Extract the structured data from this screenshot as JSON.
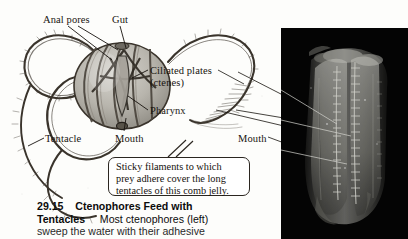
{
  "figure": {
    "domain_kind": "textbook-figure",
    "background_color": "#fdfdfb",
    "ink_color": "#18140f"
  },
  "diagram": {
    "title_implied": "Ctenophore (comb jelly) anatomy drawing",
    "labels": [
      {
        "id": "anal-pores",
        "text": "Anal pores"
      },
      {
        "id": "gut",
        "text": "Gut"
      },
      {
        "id": "ciliated-plates",
        "text": "Ciliated plates"
      },
      {
        "id": "ctenes",
        "text": "(ctenes)"
      },
      {
        "id": "pharynx",
        "text": "Pharynx"
      },
      {
        "id": "tentacle",
        "text": "Tentacle"
      },
      {
        "id": "mouth-diagram",
        "text": "Mouth"
      },
      {
        "id": "mouth-photo",
        "text": "Mouth"
      }
    ]
  },
  "callout": {
    "lines": [
      "Sticky filaments to which",
      "prey adhere cover the long",
      "tentacles of this comb jelly."
    ]
  },
  "caption": {
    "number": "29.15",
    "title_part1": "Ctenophores Feed with",
    "title_part2": "Tentacles",
    "body_line2": "Most ctenophores (left)",
    "body_line3": "sweep the water with their adhesive"
  },
  "photo": {
    "alt": "black-and-white photograph of a comb jelly ctenophore on black background",
    "background_color": "#050505",
    "subject_color": "#b9b9b4"
  }
}
